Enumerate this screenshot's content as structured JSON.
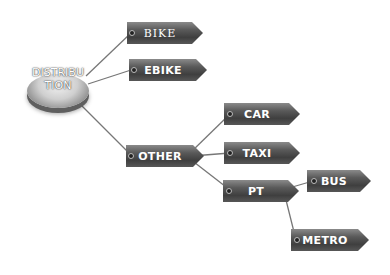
{
  "diagram": {
    "type": "tree",
    "root": {
      "label_line1": "DISTRIBU",
      "label_line2": "TION",
      "full_label": "DISTRIBUTION"
    },
    "nodes": {
      "bike": "BIKE",
      "ebike": "EBIKE",
      "other": "OTHER",
      "car": "CAR",
      "taxi": "TAXI",
      "pt": "PT",
      "bus": "BUS",
      "metro": "METRO"
    },
    "edges": [
      [
        "DISTRIBUTION",
        "BIKE"
      ],
      [
        "DISTRIBUTION",
        "EBIKE"
      ],
      [
        "DISTRIBUTION",
        "OTHER"
      ],
      [
        "OTHER",
        "CAR"
      ],
      [
        "OTHER",
        "TAXI"
      ],
      [
        "OTHER",
        "PT"
      ],
      [
        "PT",
        "BUS"
      ],
      [
        "PT",
        "METRO"
      ]
    ],
    "colors": {
      "tag": "#4a4a4a",
      "line": "#6e6e6e",
      "text": "#ffffff"
    }
  }
}
